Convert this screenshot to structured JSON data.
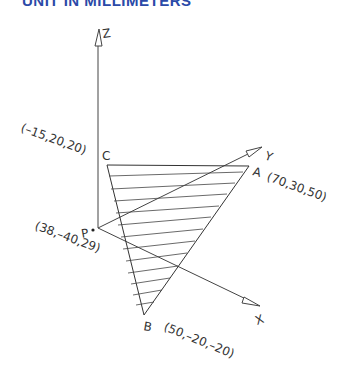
{
  "heading": "UNIT IN MILLIMETERS",
  "axes": {
    "x_label": "X",
    "y_label": "Y",
    "z_label": "Z"
  },
  "points": {
    "A": {
      "label": "A",
      "coords": "(70,30,50)"
    },
    "B": {
      "label": "B",
      "coords": "(50,–20,–20)"
    },
    "C": {
      "label": "C",
      "coords": "(–15,20,20)"
    },
    "P": {
      "label": "P",
      "coords": "(38,–40,29)"
    }
  },
  "colors": {
    "heading": "#2b4aa8",
    "lines": "#444444"
  }
}
